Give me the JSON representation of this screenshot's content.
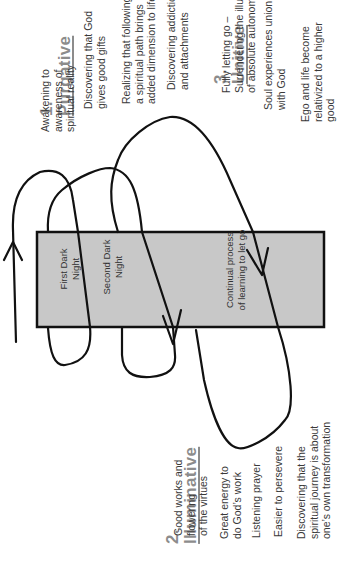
{
  "stages": {
    "purgative": {
      "number": "1.",
      "title": "Purgative",
      "items": [
        "Awakening to\nawareness of\nspiritual reality",
        "Discovering that God\ngives good gifts",
        "Realizing that following\na spiritual path brings\nadded dimension to life",
        "Discovering addictions\nand attachments"
      ]
    },
    "illuminative": {
      "number": "2.",
      "title": "Illuminative",
      "items": [
        "Good works and\nflowering\nof the virtues",
        "Great energy to\ndo God’s work",
        "Listening prayer",
        "Easier to persevere",
        "Discovering that the\nspiritual journey is about\none’s own transformation"
      ]
    },
    "unitive": {
      "number": "3.",
      "title": "Unitive",
      "items": [
        "Fully letting go –\nSurrendering the illusion\nof absolute autonomy",
        "Soul experiences union\nwith God",
        "Ego and life become\nrelativized to a higher\ngood"
      ]
    }
  },
  "box": {
    "fill": "#c8c8c8",
    "labels": {
      "first_dark_night": "First Dark\nNight",
      "second_dark_night": "Second Dark\nNight",
      "continual_process": "Continual process\nof learning to let go"
    }
  },
  "colors": {
    "heading": "#8c8c8c",
    "text": "#3a3a3a",
    "line": "#111111"
  }
}
